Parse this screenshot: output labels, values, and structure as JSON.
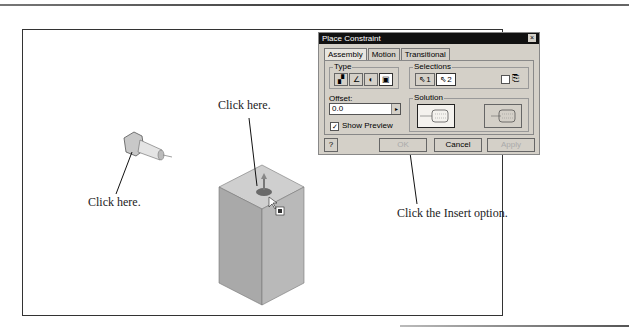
{
  "callouts": {
    "bolt": "Click here.",
    "block": "Click here.",
    "insert": "Click the Insert option."
  },
  "dialog": {
    "title": "Place Constraint",
    "close_icon": "×",
    "tabs": [
      {
        "label": "Assembly",
        "active": true
      },
      {
        "label": "Motion",
        "active": false
      },
      {
        "label": "Transitional",
        "active": false
      }
    ],
    "type_group": {
      "label": "Type",
      "buttons": [
        "mate-icon",
        "angle-icon",
        "tangent-icon",
        "insert-icon"
      ],
      "selected": "insert-icon"
    },
    "selections_group": {
      "label": "Selections",
      "buttons": [
        {
          "label": "1"
        },
        {
          "label": "2"
        }
      ],
      "glyph": "⇖"
    },
    "offset": {
      "label": "Offset:",
      "value": "0.0"
    },
    "show_preview": {
      "label": "Show Preview",
      "checked": true
    },
    "solution_group": {
      "label": "Solution",
      "options": [
        "opposed",
        "aligned"
      ],
      "selected": "opposed"
    },
    "buttons": {
      "help": "?",
      "ok": "OK",
      "cancel": "Cancel",
      "apply": "Apply"
    }
  }
}
